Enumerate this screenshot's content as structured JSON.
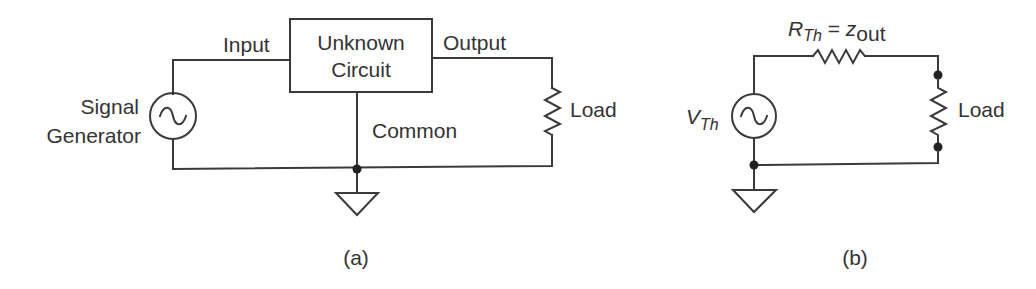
{
  "figure_a": {
    "caption": "(a)",
    "box": {
      "line1": "Unknown",
      "line2": "Circuit"
    },
    "labels": {
      "input": "Input",
      "output": "Output",
      "common": "Common",
      "load": "Load",
      "generator_line1": "Signal",
      "generator_line2": "Generator"
    }
  },
  "figure_b": {
    "caption": "(b)",
    "labels": {
      "source_main": "V",
      "source_sub": "Th",
      "resistor_main": "R",
      "resistor_sub": "Th",
      "equals": " = ",
      "impedance_main": "z",
      "impedance_sub": "out",
      "load": "Load"
    }
  },
  "colors": {
    "line": "#3a3a3a",
    "text": "#333333",
    "background": "#ffffff"
  }
}
